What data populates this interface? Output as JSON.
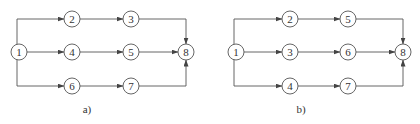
{
  "diagrams": [
    {
      "caption": "a)",
      "nodes": [
        {
          "id": "1",
          "x": 19,
          "y": 52
        },
        {
          "id": "2",
          "x": 72,
          "y": 19
        },
        {
          "id": "3",
          "x": 131,
          "y": 19
        },
        {
          "id": "4",
          "x": 72,
          "y": 52
        },
        {
          "id": "5",
          "x": 131,
          "y": 52
        },
        {
          "id": "6",
          "x": 72,
          "y": 86
        },
        {
          "id": "7",
          "x": 131,
          "y": 86
        },
        {
          "id": "8",
          "x": 186,
          "y": 52
        }
      ],
      "edges": [
        [
          "1",
          "2"
        ],
        [
          "2",
          "3"
        ],
        [
          "3",
          "8"
        ],
        [
          "1",
          "4"
        ],
        [
          "4",
          "5"
        ],
        [
          "5",
          "8"
        ],
        [
          "1",
          "6"
        ],
        [
          "6",
          "7"
        ],
        [
          "7",
          "8"
        ]
      ]
    },
    {
      "caption": "b)",
      "nodes": [
        {
          "id": "1",
          "x": 236,
          "y": 52
        },
        {
          "id": "2",
          "x": 290,
          "y": 19
        },
        {
          "id": "5",
          "x": 348,
          "y": 19
        },
        {
          "id": "3",
          "x": 290,
          "y": 52
        },
        {
          "id": "6",
          "x": 348,
          "y": 52
        },
        {
          "id": "4",
          "x": 290,
          "y": 86
        },
        {
          "id": "7",
          "x": 348,
          "y": 86
        },
        {
          "id": "8",
          "x": 403,
          "y": 52
        }
      ],
      "edges": [
        [
          "1",
          "2"
        ],
        [
          "2",
          "5"
        ],
        [
          "5",
          "8"
        ],
        [
          "1",
          "3"
        ],
        [
          "3",
          "6"
        ],
        [
          "6",
          "8"
        ],
        [
          "1",
          "4"
        ],
        [
          "4",
          "7"
        ],
        [
          "7",
          "8"
        ]
      ]
    }
  ],
  "colors": {
    "stroke": "#555555",
    "text": "#333333",
    "background": "#ffffff"
  }
}
